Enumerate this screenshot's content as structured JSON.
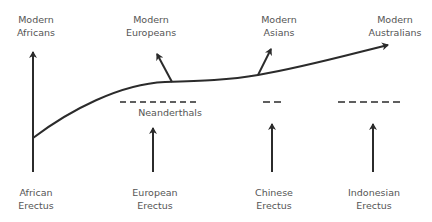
{
  "colors": {
    "line": "#2b2b2b",
    "text": "#555555",
    "background": "#ffffff"
  },
  "top_labels": [
    {
      "id": "modern-africans",
      "line1": "Modern",
      "line2": "Africans"
    },
    {
      "id": "modern-europeans",
      "line1": "Modern",
      "line2": "Europeans"
    },
    {
      "id": "modern-asians",
      "line1": "Modern",
      "line2": "Asians"
    },
    {
      "id": "modern-australians",
      "line1": "Modern",
      "line2": "Australians"
    }
  ],
  "middle_labels": [
    {
      "id": "neanderthals",
      "text": "Neanderthals"
    }
  ],
  "bottom_labels": [
    {
      "id": "african-erectus",
      "line1": "African",
      "line2": "Erectus"
    },
    {
      "id": "european-erectus",
      "line1": "European",
      "line2": "Erectus"
    },
    {
      "id": "chinese-erectus",
      "line1": "Chinese",
      "line2": "Erectus"
    },
    {
      "id": "indonesian-erectus",
      "line1": "Indonesian",
      "line2": "Erectus"
    }
  ]
}
